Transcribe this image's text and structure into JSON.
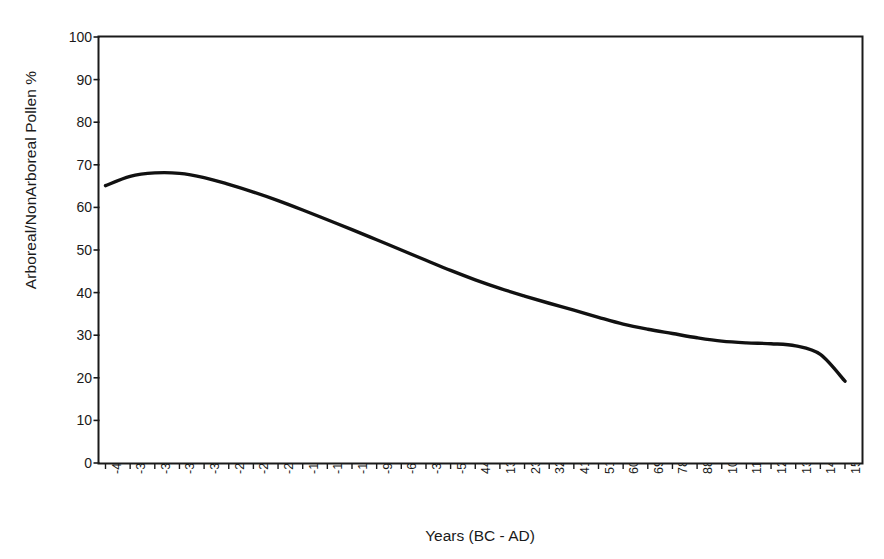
{
  "chart_data": {
    "type": "line",
    "title": "",
    "xlabel": "Years (BC - AD)",
    "ylabel": "Arboreal/NonArboreal Pollen %",
    "ylim": [
      0,
      100
    ],
    "ytick_labels": [
      "100",
      "90",
      "80",
      "70",
      "60",
      "50",
      "40",
      "30",
      "20",
      "10",
      "0"
    ],
    "ytick_values": [
      100,
      90,
      80,
      70,
      60,
      50,
      40,
      30,
      20,
      10,
      0
    ],
    "grid": false,
    "legend": "none",
    "categories": [
      "-4197",
      "-3901",
      "-3605",
      "-3308",
      "-3012",
      "-2716",
      "-2420",
      "-2123",
      "-1827",
      "-1531",
      "-1235",
      "-938",
      "-642",
      "-346",
      "-50",
      "44",
      "137",
      "230",
      "323",
      "416",
      "510",
      "603",
      "696",
      "789",
      "882",
      "1069",
      "1162",
      "1255",
      "1348",
      "1441",
      "1535"
    ],
    "series": [
      {
        "name": "Arboreal/NonArboreal Pollen %",
        "color": "#111111",
        "values": [
          65.1,
          67.3,
          68.1,
          68.0,
          67.0,
          65.4,
          63.6,
          61.6,
          59.4,
          57.1,
          54.8,
          52.4,
          50.0,
          47.6,
          45.2,
          43.0,
          41.0,
          39.2,
          37.5,
          35.9,
          34.2,
          32.6,
          31.4,
          30.4,
          29.4,
          28.6,
          28.2,
          28.0,
          27.5,
          25.5,
          19.2
        ]
      }
    ]
  },
  "axes": {
    "y_axis_title": "Arboreal/NonArboreal Pollen %",
    "x_axis_title": "Years (BC - AD)"
  }
}
